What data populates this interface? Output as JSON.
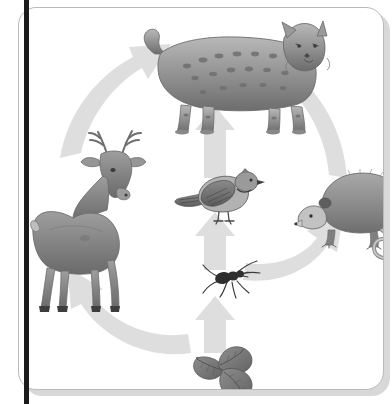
{
  "diagram": {
    "type": "food-web",
    "background_color": "#ffffff",
    "card": {
      "border_color": "#b9b9b9",
      "fill_color": "#ffffff",
      "corner_radius_px": 18,
      "shadow_color": "#d8d8d8"
    },
    "spine": {
      "color": "#1b1b1b",
      "width_px": 5
    },
    "arrow_color": "#dedede",
    "art_ink_color": "#5a5a5a",
    "nodes": [
      {
        "id": "bobcat",
        "label": "bobcat",
        "common_name": "Bobcat",
        "trophic_level": "tertiary consumer",
        "position": "top-center",
        "x": 210,
        "y": 68
      },
      {
        "id": "deer",
        "label": "deer",
        "common_name": "White-tailed deer",
        "trophic_level": "primary consumer",
        "position": "left",
        "x": 72,
        "y": 198
      },
      {
        "id": "bird",
        "label": "bird",
        "common_name": "Blue jay",
        "trophic_level": "secondary consumer",
        "position": "center",
        "x": 199,
        "y": 190
      },
      {
        "id": "opossum",
        "label": "opossum",
        "common_name": "Virginia opossum",
        "trophic_level": "secondary consumer",
        "position": "right",
        "x": 320,
        "y": 200
      },
      {
        "id": "insect",
        "label": "insect",
        "common_name": "Ant",
        "trophic_level": "primary consumer",
        "position": "center-lower",
        "x": 205,
        "y": 273
      },
      {
        "id": "plant",
        "label": "plant",
        "common_name": "Leafy plant",
        "trophic_level": "producer",
        "position": "bottom-center",
        "x": 211,
        "y": 365
      }
    ],
    "arrows": [
      {
        "id": "plant-to-insect",
        "from": "plant",
        "to": "insect",
        "shape": "straight",
        "direction": "up"
      },
      {
        "id": "insect-to-bird",
        "from": "insect",
        "to": "bird",
        "shape": "straight",
        "direction": "up"
      },
      {
        "id": "bird-to-bobcat",
        "from": "bird",
        "to": "bobcat",
        "shape": "straight",
        "direction": "up"
      },
      {
        "id": "plant-to-deer",
        "from": "plant",
        "to": "deer",
        "shape": "curved",
        "direction": "counter-clockwise"
      },
      {
        "id": "deer-to-bobcat",
        "from": "deer",
        "to": "bobcat",
        "shape": "curved",
        "direction": "counter-clockwise"
      },
      {
        "id": "insect-to-opossum",
        "from": "insect",
        "to": "opossum",
        "shape": "curved",
        "direction": "clockwise"
      },
      {
        "id": "opossum-to-bobcat",
        "from": "opossum",
        "to": "bobcat",
        "shape": "curved",
        "direction": "clockwise"
      }
    ]
  }
}
